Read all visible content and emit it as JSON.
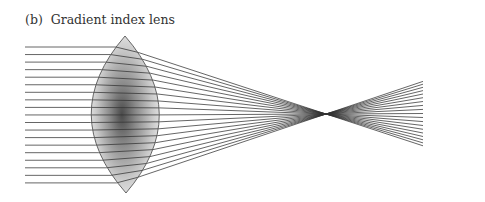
{
  "figure": {
    "caption": "(b)  Gradient index lens",
    "label": "(b)",
    "title": "Gradient index lens"
  },
  "diagram": {
    "lens": {
      "cx": 125,
      "top_y": 36,
      "bottom_y": 193,
      "left_x": 90,
      "right_x": 160
    },
    "rays": {
      "count": 19,
      "start_x": 25,
      "first_y": 47,
      "spacing": 7.55
    },
    "focus": {
      "x": 326,
      "y": 114
    },
    "exit_fan": {
      "end_x": 423,
      "top_y": 79,
      "bottom_y": 148
    },
    "colors": {
      "ray": "#333333",
      "lens_edge": "#555555",
      "lens_dark": "#555555",
      "lens_light": "#e8e8e8"
    }
  }
}
